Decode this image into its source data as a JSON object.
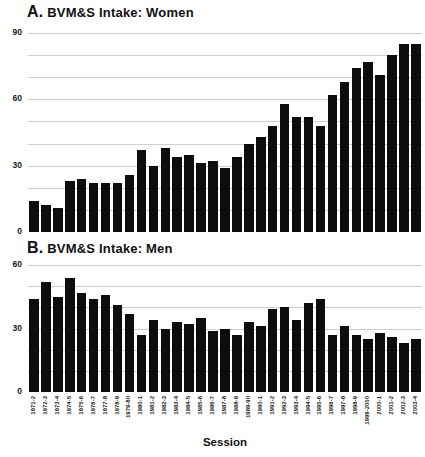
{
  "chart_data": [
    {
      "type": "bar",
      "panel_label": "A.",
      "title": "BVM&S Intake: Women",
      "categories": [
        "1971-2",
        "1972-3",
        "1973-4",
        "1974-5",
        "1975-6",
        "1976-7",
        "1977-8",
        "1978-9",
        "1979-80",
        "1980-1",
        "1981-2",
        "1982-3",
        "1983-4",
        "1984-5",
        "1985-6",
        "1986-7",
        "1987-8",
        "1988-9",
        "1989-90",
        "1990-1",
        "1991-2",
        "1992-3",
        "1993-4",
        "1994-5",
        "1995-6",
        "1996-7",
        "1997-8",
        "1998-9",
        "1999-2000",
        "2000-1",
        "2001-2",
        "2002-3",
        "2003-4"
      ],
      "values": [
        14,
        12,
        11,
        23,
        24,
        22,
        22,
        22,
        26,
        37,
        30,
        38,
        34,
        35,
        31,
        32,
        29,
        34,
        40,
        43,
        48,
        58,
        52,
        52,
        48,
        62,
        68,
        74,
        77,
        71,
        80,
        85,
        85
      ],
      "ylim": [
        0,
        90
      ],
      "yticks": [
        0,
        30,
        60,
        90
      ],
      "grid_step": 10,
      "grid": "on",
      "legend": "none",
      "bar_color": "#0d0d0d",
      "xlabel": "Session"
    },
    {
      "type": "bar",
      "panel_label": "B.",
      "title": "BVM&S Intake: Men",
      "categories": [
        "1971-2",
        "1972-3",
        "1973-4",
        "1974-5",
        "1975-6",
        "1976-7",
        "1977-8",
        "1978-9",
        "1979-80",
        "1980-1",
        "1981-2",
        "1982-3",
        "1983-4",
        "1984-5",
        "1985-6",
        "1986-7",
        "1987-8",
        "1988-9",
        "1989-90",
        "1990-1",
        "1991-2",
        "1992-3",
        "1993-4",
        "1994-5",
        "1995-6",
        "1996-7",
        "1997-8",
        "1998-9",
        "1999-2000",
        "2000-1",
        "2001-2",
        "2002-3",
        "2003-4"
      ],
      "values": [
        44,
        52,
        45,
        54,
        47,
        44,
        46,
        41,
        37,
        27,
        34,
        30,
        33,
        32,
        35,
        29,
        30,
        27,
        33,
        31,
        39,
        40,
        34,
        42,
        44,
        27,
        31,
        27,
        25,
        28,
        26,
        23,
        25
      ],
      "ylim": [
        0,
        60
      ],
      "yticks": [
        0,
        30,
        60
      ],
      "grid_step": 10,
      "grid": "on",
      "legend": "none",
      "bar_color": "#0d0d0d",
      "xlabel": "Session"
    }
  ]
}
